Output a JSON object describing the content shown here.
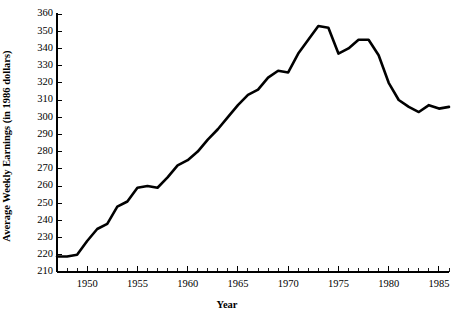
{
  "chart_data": {
    "type": "line",
    "title": "",
    "subtitle": "",
    "xlabel": "Year",
    "ylabel": "Average Weekly Earnings (in 1986 dollars)",
    "xlim": [
      1947,
      1986
    ],
    "ylim": [
      210,
      360
    ],
    "grid": false,
    "legend": null,
    "x_major_ticks": [
      1950,
      1955,
      1960,
      1965,
      1970,
      1975,
      1980,
      1985
    ],
    "x_major_tick_labels": [
      "1950",
      "1955",
      "1960",
      "1965",
      "1970",
      "1975",
      "1980",
      "1985"
    ],
    "x_minor_tick_step": 1,
    "y_ticks": [
      210,
      220,
      230,
      240,
      250,
      260,
      270,
      280,
      290,
      300,
      310,
      320,
      330,
      340,
      350,
      360
    ],
    "y_tick_labels": [
      "210",
      "220",
      "230",
      "240",
      "250",
      "260",
      "270",
      "280",
      "290",
      "300",
      "310",
      "320",
      "330",
      "340",
      "350",
      "360"
    ],
    "line_color": "#000000",
    "x": [
      1947,
      1948,
      1949,
      1950,
      1951,
      1952,
      1953,
      1954,
      1955,
      1956,
      1957,
      1958,
      1959,
      1960,
      1961,
      1962,
      1963,
      1964,
      1965,
      1966,
      1967,
      1968,
      1969,
      1970,
      1971,
      1972,
      1973,
      1974,
      1975,
      1976,
      1977,
      1978,
      1979,
      1980,
      1981,
      1982,
      1983,
      1984,
      1985,
      1986
    ],
    "values": [
      219,
      219,
      220,
      228,
      235,
      238,
      248,
      251,
      259,
      260,
      259,
      265,
      272,
      275,
      280,
      287,
      293,
      300,
      307,
      313,
      316,
      323,
      327,
      326,
      337,
      345,
      353,
      352,
      337,
      340,
      345,
      345,
      336,
      320,
      310,
      306,
      303,
      307,
      305,
      306
    ]
  },
  "geometry": {
    "plot_left": 57,
    "plot_right": 449,
    "plot_top": 14,
    "plot_bottom": 272
  }
}
